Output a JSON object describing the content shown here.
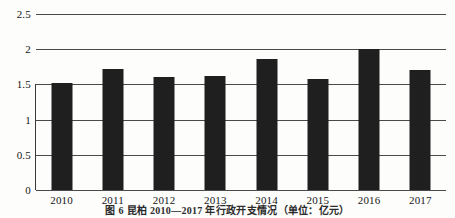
{
  "chart_data": {
    "type": "bar",
    "title": "",
    "categories": [
      "2010",
      "2011",
      "2012",
      "2013",
      "2014",
      "2015",
      "2016",
      "2017"
    ],
    "values": [
      1.52,
      1.72,
      1.6,
      1.62,
      1.86,
      1.57,
      2.0,
      1.71
    ],
    "series": [
      {
        "name": "",
        "values": [
          1.52,
          1.72,
          1.6,
          1.62,
          1.86,
          1.57,
          2.0,
          1.71
        ]
      }
    ],
    "xlabel": "",
    "ylabel": "",
    "ylim": [
      0,
      2.5
    ],
    "yticks": [
      "0",
      "0.5",
      "1",
      "1.5",
      "2",
      "2.5"
    ],
    "ytick_values": [
      0,
      0.5,
      1,
      1.5,
      2,
      2.5
    ],
    "grid": true,
    "legend": false,
    "bar_color": "#201f1f",
    "gridline_color": "#4a4a4a"
  },
  "caption": {
    "text": "图 6  昆柏 2010—2017 年行政开支情况（单位：亿元）"
  }
}
